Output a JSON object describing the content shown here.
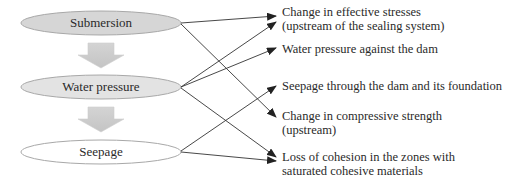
{
  "causes": [
    {
      "id": "submersion",
      "label": "Submersion",
      "fill": "#d9d9d9"
    },
    {
      "id": "water_pressure",
      "label": "Water pressure",
      "fill": "#e6e6e6"
    },
    {
      "id": "seepage",
      "label": "Seepage",
      "fill": "#ffffff"
    }
  ],
  "effects": [
    {
      "id": "effective_stresses",
      "line1": "Change in effective stresses",
      "line2": "(upstream of the sealing system)"
    },
    {
      "id": "water_pressure_dam",
      "line1": "Water pressure against the dam",
      "line2": ""
    },
    {
      "id": "seepage_dam",
      "line1": "Seepage through the dam and its foundation",
      "line2": ""
    },
    {
      "id": "compressive_strength",
      "line1": "Change in compressive strength",
      "line2": "(upstream)"
    },
    {
      "id": "loss_cohesion",
      "line1": "Loss of cohesion in the zones with",
      "line2": "saturated cohesive materials"
    }
  ],
  "links": [
    {
      "from": "submersion",
      "to": "effective_stresses"
    },
    {
      "from": "submersion",
      "to": "compressive_strength"
    },
    {
      "from": "water_pressure",
      "to": "effective_stresses"
    },
    {
      "from": "water_pressure",
      "to": "water_pressure_dam"
    },
    {
      "from": "water_pressure",
      "to": "loss_cohesion"
    },
    {
      "from": "seepage",
      "to": "seepage_dam"
    },
    {
      "from": "seepage",
      "to": "loss_cohesion"
    }
  ]
}
